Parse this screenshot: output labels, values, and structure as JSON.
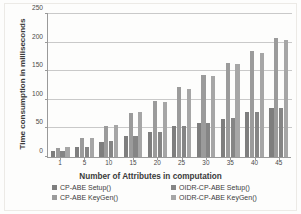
{
  "chart_data": {
    "type": "bar",
    "title": "",
    "xlabel": "Number of Attributes in computation",
    "ylabel": "Time consumption in milliseconds",
    "categories": [
      "1",
      "5",
      "10",
      "15",
      "20",
      "25",
      "30",
      "35",
      "40",
      "45"
    ],
    "ylim": [
      0,
      250
    ],
    "yticks": [
      0,
      50,
      100,
      150,
      200,
      250
    ],
    "ytick_labels": [
      "0",
      "50",
      "100",
      "150",
      "200",
      "250"
    ],
    "grid": true,
    "legend_position": "bottom",
    "series": [
      {
        "name": "CP-ABE Setup()",
        "color": "#7e7e7e",
        "values": [
          10,
          17,
          27,
          36,
          43,
          54,
          59,
          67,
          78,
          85
        ]
      },
      {
        "name": "CP-ABE KeyGen()",
        "color": "#9b9b9b",
        "values": [
          16,
          33,
          54,
          77,
          98,
          123,
          144,
          165,
          185,
          208
        ]
      },
      {
        "name": "OIDR-CP-ABE Setup()",
        "color": "#858585",
        "values": [
          11,
          18,
          28,
          37,
          44,
          55,
          60,
          68,
          79,
          86
        ]
      },
      {
        "name": "OIDR-CP-ABE KeyGen()",
        "color": "#a6a6a6",
        "values": [
          17,
          34,
          56,
          79,
          97,
          119,
          142,
          162,
          182,
          204
        ]
      }
    ],
    "legend": [
      "CP-ABE Setup()",
      "OIDR-CP-ABE Setup()",
      "CP-ABE KeyGen()",
      "OIDR-CP-ABE KeyGen()"
    ]
  }
}
